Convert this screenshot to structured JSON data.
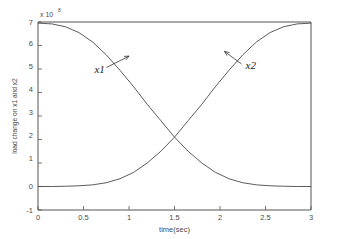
{
  "chart_data": {
    "type": "line",
    "title": "",
    "xlabel": "time(sec)",
    "ylabel": "load change on x1 and x2",
    "y_exponent_prefix": "x 10",
    "y_exponent_power": "8",
    "xlim": [
      0,
      3
    ],
    "ylim": [
      -1,
      7
    ],
    "grid": false,
    "legend": "none",
    "xticks": [
      "0",
      "0.5",
      "1",
      "1.5",
      "2",
      "2.5",
      "3"
    ],
    "xtick_values": [
      0,
      0.5,
      1,
      1.5,
      2,
      2.5,
      3
    ],
    "yticks": [
      "-1",
      "0",
      "1",
      "2",
      "3",
      "4",
      "5",
      "6",
      "7"
    ],
    "ytick_values": [
      -1,
      0,
      1,
      2,
      3,
      4,
      5,
      6,
      7
    ],
    "x": [
      0,
      0.15,
      0.3,
      0.45,
      0.6,
      0.75,
      0.9,
      1.05,
      1.2,
      1.35,
      1.5,
      1.65,
      1.8,
      1.95,
      2.1,
      2.25,
      2.4,
      2.55,
      2.7,
      2.85,
      3
    ],
    "series": [
      {
        "name": "x1",
        "values": [
          6.95,
          6.92,
          6.8,
          6.55,
          6.15,
          5.6,
          4.95,
          4.25,
          3.5,
          2.8,
          2.1,
          1.5,
          1.0,
          0.6,
          0.33,
          0.16,
          0.07,
          0.03,
          0.01,
          0.0,
          0.0
        ]
      },
      {
        "name": "x2",
        "values": [
          0.0,
          0.0,
          0.01,
          0.03,
          0.07,
          0.16,
          0.33,
          0.6,
          1.0,
          1.5,
          2.1,
          2.8,
          3.5,
          4.25,
          4.95,
          5.6,
          6.15,
          6.55,
          6.8,
          6.92,
          6.95
        ]
      }
    ],
    "annotations": [
      {
        "text": "x1",
        "label_x": 0.62,
        "label_y": 4.85,
        "point_x": 1.0,
        "point_y": 5.55
      },
      {
        "text": "x2",
        "label_x": 2.28,
        "label_y": 5.0,
        "point_x": 2.05,
        "point_y": 5.75
      }
    ],
    "crossing_point": {
      "x": 1.5,
      "y": 3.5
    }
  }
}
